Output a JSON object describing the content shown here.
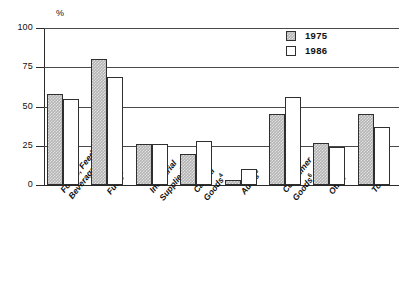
{
  "chart_data": {
    "type": "bar",
    "title": "",
    "subtitle": "",
    "xlabel": "",
    "ylabel": "%",
    "ylim": [
      0,
      100
    ],
    "yticks": [
      0,
      25,
      50,
      75,
      100
    ],
    "ytick_labels": [
      "0",
      "25",
      "50",
      "75",
      "100"
    ],
    "grid": "horizontal",
    "legend_position": "top-right",
    "categories": [
      "Foods, Feeds, and\nBeverages",
      "Fuels",
      "Industrial\nSupplies",
      "Capital\nGoods",
      "Autos",
      "Consumer\nGoods",
      "Other",
      "Total"
    ],
    "category_footnotes": [
      "",
      "3",
      "3",
      "4",
      "5",
      "6",
      "7",
      ""
    ],
    "series": [
      {
        "name": "1975",
        "values": [
          58,
          80,
          26,
          20,
          3,
          45,
          27,
          45
        ]
      },
      {
        "name": "1986",
        "values": [
          55,
          69,
          26,
          28,
          10,
          56,
          24,
          37
        ]
      }
    ]
  },
  "axis": {
    "unit_label": "%",
    "ticks": [
      {
        "label": "100",
        "value": 100
      },
      {
        "label": "75",
        "value": 75
      },
      {
        "label": "50",
        "value": 50
      },
      {
        "label": "25",
        "value": 25
      },
      {
        "label": "0",
        "value": 0
      }
    ]
  },
  "legend": {
    "items": [
      {
        "label": "1975",
        "swatch": "hatched-gray",
        "color": "#b4b4b4"
      },
      {
        "label": "1986",
        "swatch": "white",
        "color": "#ffffff"
      }
    ]
  },
  "colors": {
    "series_1975": "#b4b4b4",
    "series_1986": "#ffffff",
    "outline": "#2f2f2f",
    "gridline": "#4a4a4a",
    "background": "#ffffff"
  }
}
